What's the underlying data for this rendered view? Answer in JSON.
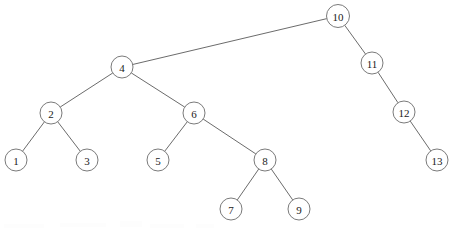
{
  "figure": {
    "type": "binary-search-tree",
    "width": 456,
    "height": 232,
    "background_color": "#ffffff",
    "node_fill_color": "#ffffff",
    "node_stroke_color": "#6b6b6b",
    "edge_stroke_color": "#5a5a5a",
    "label_color": "#1a1a1a",
    "node_radius": 11
  },
  "nodes": [
    {
      "id": "n10",
      "label": "10",
      "cx": 338,
      "cy": 16,
      "r": 11.5,
      "depth": 0
    },
    {
      "id": "n4",
      "label": "4",
      "cx": 122,
      "cy": 67,
      "r": 11,
      "depth": 1
    },
    {
      "id": "n11",
      "label": "11",
      "cx": 372,
      "cy": 63,
      "r": 11,
      "depth": 1
    },
    {
      "id": "n2",
      "label": "2",
      "cx": 51,
      "cy": 113,
      "r": 11,
      "depth": 2
    },
    {
      "id": "n6",
      "label": "6",
      "cx": 194,
      "cy": 113,
      "r": 11,
      "depth": 2
    },
    {
      "id": "n12",
      "label": "12",
      "cx": 404,
      "cy": 112,
      "r": 11,
      "depth": 2
    },
    {
      "id": "n1",
      "label": "1",
      "cx": 16,
      "cy": 160,
      "r": 11,
      "depth": 3
    },
    {
      "id": "n3",
      "label": "3",
      "cx": 87,
      "cy": 160,
      "r": 11,
      "depth": 3
    },
    {
      "id": "n5",
      "label": "5",
      "cx": 158,
      "cy": 160,
      "r": 11,
      "depth": 3
    },
    {
      "id": "n8",
      "label": "8",
      "cx": 265,
      "cy": 160,
      "r": 11,
      "depth": 3
    },
    {
      "id": "n13",
      "label": "13",
      "cx": 437,
      "cy": 160,
      "r": 11,
      "depth": 3
    },
    {
      "id": "n7",
      "label": "7",
      "cx": 231,
      "cy": 209,
      "r": 11,
      "depth": 4
    },
    {
      "id": "n9",
      "label": "9",
      "cx": 299,
      "cy": 209,
      "r": 11,
      "depth": 4
    }
  ],
  "edges": [
    {
      "id": "e-10-4",
      "from": "n10",
      "to": "n4",
      "side": "left"
    },
    {
      "id": "e-10-11",
      "from": "n10",
      "to": "n11",
      "side": "right"
    },
    {
      "id": "e-4-2",
      "from": "n4",
      "to": "n2",
      "side": "left"
    },
    {
      "id": "e-4-6",
      "from": "n4",
      "to": "n6",
      "side": "right"
    },
    {
      "id": "e-11-12",
      "from": "n11",
      "to": "n12",
      "side": "right"
    },
    {
      "id": "e-2-1",
      "from": "n2",
      "to": "n1",
      "side": "left"
    },
    {
      "id": "e-2-3",
      "from": "n2",
      "to": "n3",
      "side": "right"
    },
    {
      "id": "e-6-5",
      "from": "n6",
      "to": "n5",
      "side": "left"
    },
    {
      "id": "e-6-8",
      "from": "n6",
      "to": "n8",
      "side": "right"
    },
    {
      "id": "e-12-13",
      "from": "n12",
      "to": "n13",
      "side": "right"
    },
    {
      "id": "e-8-7",
      "from": "n8",
      "to": "n7",
      "side": "left"
    },
    {
      "id": "e-8-9",
      "from": "n8",
      "to": "n9",
      "side": "right"
    }
  ],
  "artifacts": [
    {
      "id": "a1",
      "x": 4,
      "y": 224,
      "w": 40,
      "h": 4
    },
    {
      "id": "a2",
      "x": 60,
      "y": 223,
      "w": 46,
      "h": 4
    },
    {
      "id": "a3",
      "x": 120,
      "y": 221,
      "w": 22,
      "h": 6
    },
    {
      "id": "a4",
      "x": 150,
      "y": 224,
      "w": 34,
      "h": 4
    },
    {
      "id": "a5",
      "x": 196,
      "y": 224,
      "w": 18,
      "h": 4
    }
  ]
}
